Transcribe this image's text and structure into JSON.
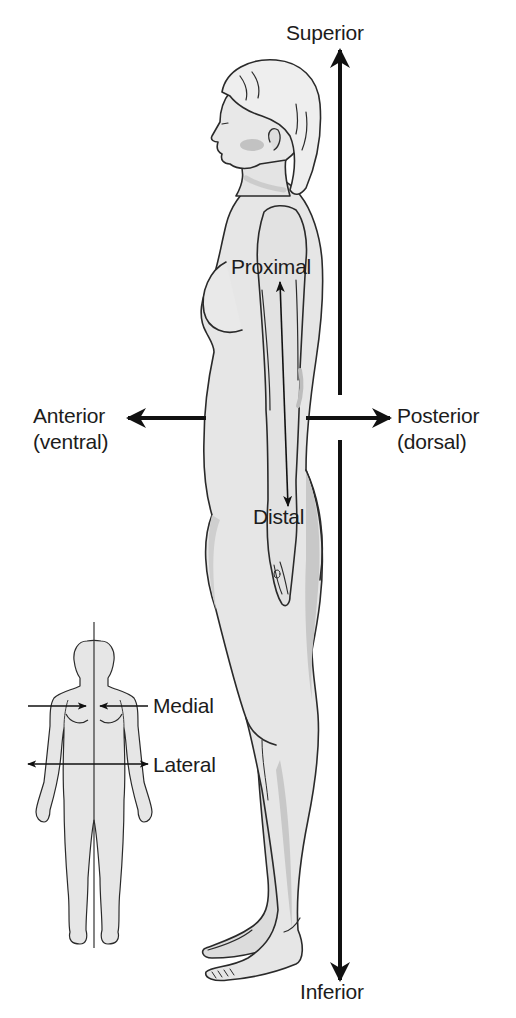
{
  "diagram": {
    "colors": {
      "background": "#ffffff",
      "skin": "#e6e6e6",
      "skin_shadow": "#c4c4c4",
      "outline": "#2a2a2a",
      "arrow": "#111111",
      "text": "#1c1c1c"
    },
    "labels": {
      "superior": "Superior",
      "inferior": "Inferior",
      "anterior": "Anterior",
      "anterior_alt": "(ventral)",
      "posterior": "Posterior",
      "posterior_alt": "(dorsal)",
      "proximal": "Proximal",
      "distal": "Distal",
      "medial": "Medial",
      "lateral": "Lateral"
    },
    "figures": [
      {
        "name": "side-profile-figure",
        "view": "lateral (right side, facing left)"
      },
      {
        "name": "front-view-figure",
        "view": "anterior with midline"
      }
    ],
    "axes": [
      {
        "name": "superior-inferior-axis",
        "orientation": "vertical",
        "from": "Superior",
        "to": "Inferior"
      },
      {
        "name": "anterior-posterior-axis",
        "orientation": "horizontal",
        "from": "Anterior (ventral)",
        "to": "Posterior (dorsal)"
      },
      {
        "name": "proximal-distal-arrow",
        "orientation": "along arm",
        "from": "Proximal",
        "to": "Distal"
      },
      {
        "name": "medial-arrows",
        "orientation": "horizontal, pointing to midline"
      },
      {
        "name": "lateral-arrow",
        "orientation": "horizontal, pointing away from midline"
      }
    ]
  }
}
